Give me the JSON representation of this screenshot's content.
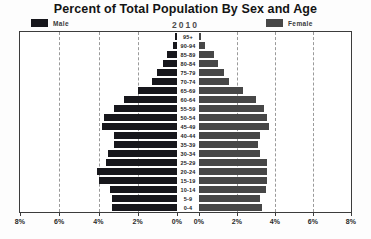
{
  "title": "Percent of Total Population By Sex and Age",
  "subtitle": "2010",
  "legend": {
    "male_label": "Male",
    "female_label": "Female"
  },
  "colors": {
    "male": "#17171c",
    "female": "#474747",
    "plot_border": "#3c3c3c",
    "gridline": "#9a9a9a"
  },
  "axis": {
    "left_tick_labels": [
      "8%",
      "6%",
      "4%",
      "2%",
      "0%"
    ],
    "right_tick_labels": [
      "0%",
      "2%",
      "4%",
      "6%",
      "8%"
    ],
    "tick_percents": [
      8,
      6,
      4,
      2,
      0
    ],
    "gridline_percents": [
      6,
      4,
      2
    ],
    "max_percent": 8
  },
  "chart_data": {
    "type": "bar",
    "subtype": "population-pyramid",
    "title": "Percent of Total Population By Sex and Age",
    "subtitle": "2010",
    "xlabel": "Percent of Total Population",
    "ylabel": "Age Group",
    "xlim_percent": [
      0,
      8
    ],
    "grid": "dashed vertical gridlines every 2%",
    "legend_position": "top (Male left, Female right)",
    "categories": [
      "95+",
      "90-94",
      "85-89",
      "80-84",
      "75-79",
      "70-74",
      "65-69",
      "60-64",
      "55-59",
      "50-54",
      "45-49",
      "40-44",
      "35-39",
      "30-34",
      "25-29",
      "20-24",
      "15-19",
      "10-14",
      "5-9",
      "0-4"
    ],
    "series": [
      {
        "name": "Male",
        "values": [
          0.1,
          0.2,
          0.5,
          0.7,
          1.0,
          1.3,
          2.0,
          2.7,
          3.2,
          3.7,
          3.8,
          3.2,
          3.2,
          3.5,
          3.6,
          4.1,
          4.0,
          3.4,
          3.3,
          3.3
        ]
      },
      {
        "name": "Female",
        "values": [
          0.1,
          0.3,
          0.8,
          1.0,
          1.3,
          1.6,
          2.3,
          3.0,
          3.4,
          3.6,
          3.7,
          3.2,
          3.1,
          3.2,
          3.6,
          3.6,
          3.6,
          3.5,
          3.2,
          3.3
        ]
      }
    ]
  }
}
